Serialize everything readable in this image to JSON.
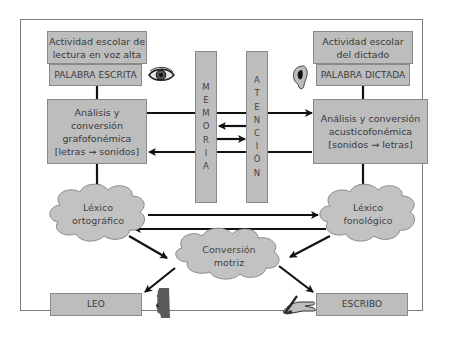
{
  "diagram": {
    "colors": {
      "box_fill": "#bdbdbd",
      "box_border": "#8a8a8a",
      "arrow": "#111111",
      "frame": "#7a7a7a"
    },
    "left": {
      "activity": "Actividad escolar de lectura en voz alta",
      "activity_lines": [
        "Actividad escolar de",
        "lectura en voz alta"
      ],
      "input": "PALABRA ESCRITA",
      "input_icon": "eye-icon",
      "analysis_lines": [
        "Análisis y conversión",
        "grafofonémica",
        "[letras → sonidos]"
      ],
      "lexicon_lines": [
        "Léxico",
        "ortográfico"
      ],
      "output": "LEO",
      "output_icon": "mouth-profile-icon"
    },
    "right": {
      "activity_lines": [
        "Actividad escolar",
        "del dictado"
      ],
      "input": "PALABRA DICTADA",
      "input_icon": "ear-icon",
      "analysis_lines": [
        "Análisis y conversión",
        "acusticofonémica",
        "[sonidos → letras]"
      ],
      "lexicon_lines": [
        "Léxico",
        "fonológico"
      ],
      "output": "ESCRIBO",
      "output_icon": "writing-hand-icon"
    },
    "center": {
      "memory_letters": [
        "M",
        "E",
        "M",
        "O",
        "R",
        "I",
        "A"
      ],
      "attention_letters": [
        "A",
        "T",
        "E",
        "N",
        "C",
        "I",
        "Ó",
        "N"
      ],
      "motor_lines": [
        "Conversión",
        "motriz"
      ]
    }
  }
}
